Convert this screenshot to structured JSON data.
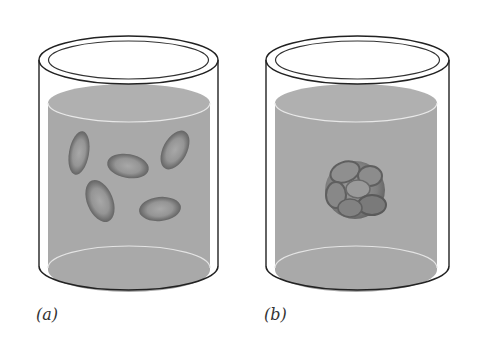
{
  "figure": {
    "panels": [
      {
        "id": "a",
        "label": "(a)",
        "description": "Beaker with liquid containing five separate dispersed red blood cells"
      },
      {
        "id": "b",
        "label": "(b)",
        "description": "Beaker with liquid containing a clumped cluster of red blood cells"
      }
    ]
  },
  "colors": {
    "liquid": "#a9a9a9",
    "liquid_top": "#b3b3b3",
    "glass_outline": "#222222",
    "cell_rim": "#6a6a6a",
    "cell_center": "#9a9a9a",
    "background": "#ffffff"
  }
}
